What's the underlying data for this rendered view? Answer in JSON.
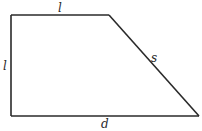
{
  "diagram": {
    "shape": "right trapezoid",
    "stroke_color": "#2a2a2a",
    "background_color": "#ffffff",
    "labels": {
      "top": "l",
      "left": "l",
      "slant": "s",
      "bottom": "d"
    }
  }
}
